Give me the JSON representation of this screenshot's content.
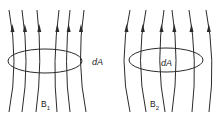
{
  "figure": {
    "panels": [
      {
        "id": "B1",
        "field_label": "B",
        "field_subscript": "1",
        "area_label": "dA",
        "description": "field lines converging toward the middle (hourglass)",
        "line_count": 6,
        "arrow_direction": "up"
      },
      {
        "id": "B2",
        "field_label": "B",
        "field_subscript": "2",
        "area_label": "dA",
        "description": "field lines bowing outward (barrel)",
        "line_count": 6,
        "arrow_direction": "up"
      }
    ],
    "colors": {
      "line": "#2a2a2a",
      "background": "#ffffff"
    }
  }
}
